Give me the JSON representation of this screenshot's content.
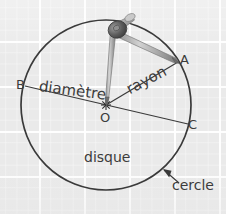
{
  "figure": {
    "kind": "geometry-diagram",
    "background": {
      "paper_color": "#eaeaea",
      "grid_line_color": "#ffffff",
      "grid_major_spacing_px": 45,
      "grid_minor_spacing_px": 11
    },
    "ink_color": "#3a3a3a",
    "circle": {
      "center_x": 106,
      "center_y": 105,
      "radius": 85,
      "stroke_color": "#3a3a3a",
      "stroke_width": 1.6,
      "fill": "none"
    },
    "points": [
      {
        "id": "A",
        "label": "A",
        "x": 178,
        "y": 62
      },
      {
        "id": "B",
        "label": "B",
        "x": 25,
        "y": 86
      },
      {
        "id": "C",
        "label": "C",
        "x": 188,
        "y": 124
      },
      {
        "id": "O",
        "label": "O",
        "x": 106,
        "y": 105
      }
    ],
    "segments": [
      {
        "id": "diameter",
        "from": "B",
        "to": "C",
        "label": "diamètre"
      },
      {
        "id": "radius",
        "from": "O",
        "to": "A",
        "label": "rayon"
      }
    ],
    "labels": {
      "diametre": "diamètre",
      "rayon": "rayon",
      "disque": "disque",
      "cercle": "cercle",
      "point_a": "A",
      "point_b": "B",
      "point_c": "C",
      "point_o": "O"
    },
    "annotation": {
      "cercle_arrow": {
        "text": "cercle",
        "points_to_x": 163,
        "points_to_y": 170,
        "tail_x": 178,
        "tail_y": 182
      }
    },
    "compass": {
      "name": "compas",
      "hinge_x": 120,
      "hinge_y": 26,
      "needle_tip_x": 107,
      "needle_tip_y": 104,
      "pencil_tip_x": 178,
      "pencil_tip_y": 62,
      "body_color": "#9a9a9a",
      "hinge_color": "#4a4a4a",
      "highlight_color": "#cfcfcf"
    }
  }
}
